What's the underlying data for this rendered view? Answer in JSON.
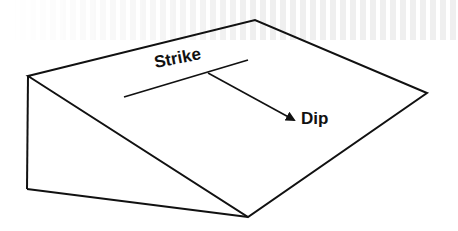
{
  "diagram": {
    "type": "geology-block-diagram",
    "line_color": "#111111",
    "background_color": "#ffffff",
    "labels": {
      "strike": "Strike",
      "dip": "Dip"
    },
    "shapes": {
      "inclined_plane": {
        "vertices": [
          [
            28,
            76
          ],
          [
            255,
            20
          ],
          [
            427,
            93
          ],
          [
            248,
            217
          ]
        ]
      },
      "side_face": {
        "vertices": [
          [
            28,
            76
          ],
          [
            27,
            189
          ],
          [
            248,
            217
          ]
        ]
      },
      "strike_line": {
        "from": [
          124,
          97
        ],
        "to": [
          248,
          60
        ]
      },
      "dip_arrow": {
        "from": [
          208,
          73
        ],
        "to": [
          294,
          120
        ]
      }
    }
  }
}
